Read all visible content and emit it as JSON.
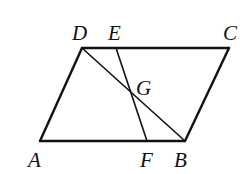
{
  "diagram": {
    "type": "geometry",
    "colors": {
      "stroke": "#111111",
      "background": "#ffffff"
    },
    "points": {
      "A": {
        "label": "A",
        "x": 40,
        "y": 141
      },
      "B": {
        "label": "B",
        "x": 185,
        "y": 141
      },
      "C": {
        "label": "C",
        "x": 229,
        "y": 48
      },
      "D": {
        "label": "D",
        "x": 82,
        "y": 48
      },
      "E": {
        "label": "E",
        "x": 116,
        "y": 48
      },
      "F": {
        "label": "F",
        "x": 147,
        "y": 141
      },
      "G": {
        "label": "G",
        "x": 130,
        "y": 88
      }
    },
    "segments": [
      {
        "from": "A",
        "to": "B"
      },
      {
        "from": "B",
        "to": "C"
      },
      {
        "from": "C",
        "to": "D"
      },
      {
        "from": "D",
        "to": "A"
      },
      {
        "from": "D",
        "to": "B"
      },
      {
        "from": "E",
        "to": "F"
      }
    ],
    "labels": {
      "A": "A",
      "B": "B",
      "C": "C",
      "D": "D",
      "E": "E",
      "F": "F",
      "G": "G"
    }
  }
}
